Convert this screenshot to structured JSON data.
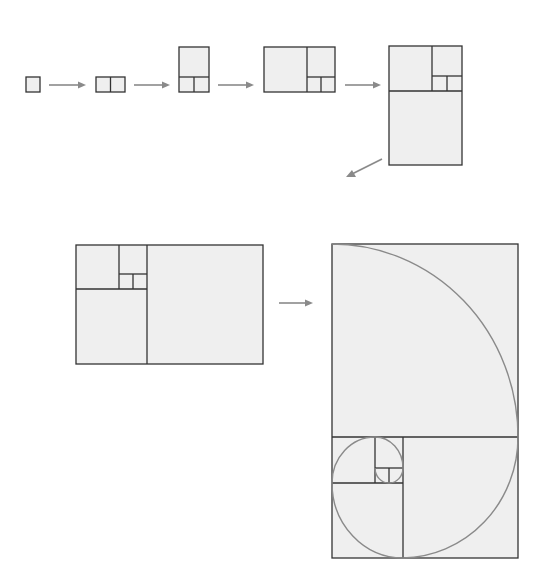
{
  "diagram": {
    "title": "",
    "colors": {
      "fill": "#efefef",
      "stroke": "#333333",
      "arrow": "#8a8a8a",
      "spiral": "#8a8a8a",
      "background": "#ffffff"
    },
    "steps": [
      {
        "id": "step-1",
        "label": "1 square",
        "squares": 1
      },
      {
        "id": "step-2",
        "label": "2 squares",
        "squares": 2
      },
      {
        "id": "step-3",
        "label": "3 squares",
        "squares": 3
      },
      {
        "id": "step-4",
        "label": "4 squares",
        "squares": 4
      },
      {
        "id": "step-5",
        "label": "5 squares",
        "squares": 5
      },
      {
        "id": "step-6",
        "label": "6 squares",
        "squares": 6
      },
      {
        "id": "step-7",
        "label": "7 squares with golden spiral",
        "squares": 7,
        "spiral": true
      }
    ],
    "fibonacci_sequence": [
      1,
      1,
      2,
      3,
      5,
      8,
      13
    ],
    "arrows": [
      {
        "from": "step-1",
        "to": "step-2"
      },
      {
        "from": "step-2",
        "to": "step-3"
      },
      {
        "from": "step-3",
        "to": "step-4"
      },
      {
        "from": "step-4",
        "to": "step-5"
      },
      {
        "from": "step-5",
        "to": "step-6"
      },
      {
        "from": "step-6",
        "to": "step-7"
      }
    ]
  }
}
